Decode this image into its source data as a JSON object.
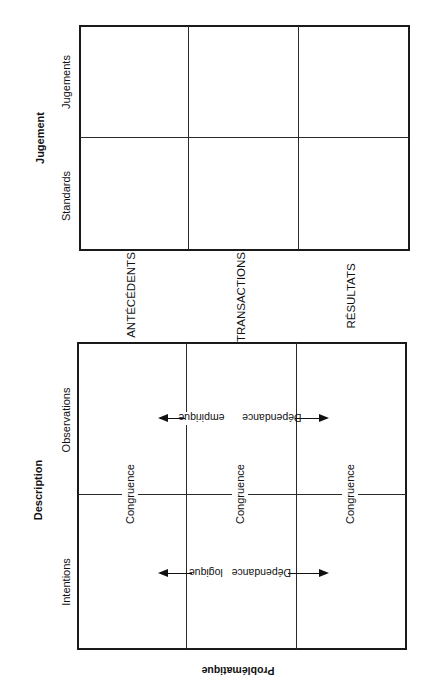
{
  "judgement_matrix": {
    "title": "Jugement",
    "rows": [
      "Jugements",
      "Standards"
    ]
  },
  "column_labels": [
    "ANTÉCÉDENTS",
    "TRANSACTIONS",
    "RÉSULTATS"
  ],
  "description_matrix": {
    "title": "Description",
    "rows": [
      "Observations",
      "Intentions"
    ],
    "congruence_labels": [
      "Congruence",
      "Congruence",
      "Congruence"
    ],
    "empirical_dependence": {
      "word1": "Dépendance",
      "word2": "empirique"
    },
    "logical_dependence": {
      "word1": "Dépendance",
      "word2": "logique"
    }
  },
  "footer": {
    "label": "Problématique"
  },
  "colors": {
    "ink": "#1a1a1a",
    "background": "#ffffff"
  }
}
